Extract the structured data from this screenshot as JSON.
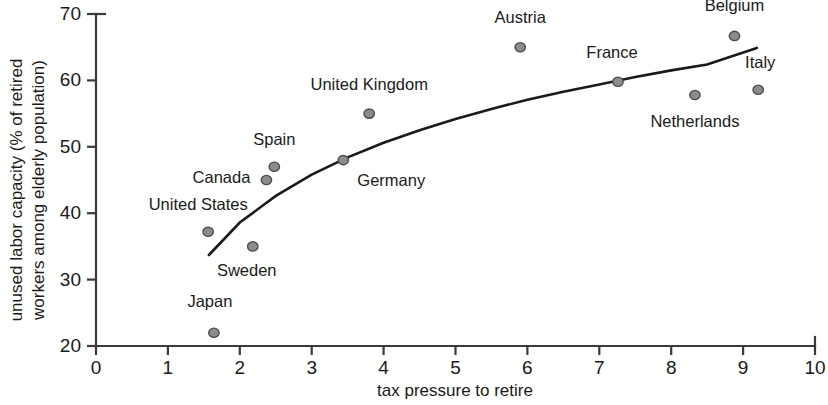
{
  "chart_data": {
    "type": "scatter",
    "title": "",
    "xlabel": "tax pressure to retire",
    "ylabel": "unused labor capacity (% of retired workers among elderly population)",
    "ylabel_line1": "unused labor capacity (% of retired",
    "ylabel_line2": "workers among elderly population)",
    "xlim": [
      0,
      10
    ],
    "ylim": [
      20,
      70
    ],
    "xticks": [
      "0",
      "1",
      "2",
      "3",
      "4",
      "5",
      "6",
      "7",
      "8",
      "9",
      "10"
    ],
    "xtick_values": [
      0,
      1,
      2,
      3,
      4,
      5,
      6,
      7,
      8,
      9,
      10
    ],
    "yticks": [
      "20",
      "30",
      "40",
      "50",
      "60",
      "70"
    ],
    "ytick_values": [
      20,
      30,
      40,
      50,
      60,
      70
    ],
    "grid": false,
    "legend": "none",
    "marker_color": "#8c8c8c",
    "marker_edge_color": "#4d4d4d",
    "curve_color": "#1a1a1a",
    "points": [
      {
        "label": "Japan",
        "x": 1.64,
        "y": 22.0,
        "label_dx": -4,
        "label_dy": -26,
        "anchor": "middle"
      },
      {
        "label": "United States",
        "x": 1.56,
        "y": 37.2,
        "label_dx": -10,
        "label_dy": -22,
        "anchor": "middle"
      },
      {
        "label": "Sweden",
        "x": 2.18,
        "y": 35.0,
        "label_dx": -6,
        "label_dy": 30,
        "anchor": "middle"
      },
      {
        "label": "Canada",
        "x": 2.37,
        "y": 45.0,
        "label_dx": -16,
        "label_dy": 3,
        "anchor": "end"
      },
      {
        "label": "Spain",
        "x": 2.48,
        "y": 47.0,
        "label_dx": 0,
        "label_dy": -22,
        "anchor": "middle"
      },
      {
        "label": "Germany",
        "x": 3.44,
        "y": 48.0,
        "label_dx": 14,
        "label_dy": 26,
        "anchor": "start"
      },
      {
        "label": "United Kingdom",
        "x": 3.8,
        "y": 55.0,
        "label_dx": 0,
        "label_dy": -24,
        "anchor": "middle"
      },
      {
        "label": "Austria",
        "x": 5.9,
        "y": 65.0,
        "label_dx": 0,
        "label_dy": -24,
        "anchor": "middle"
      },
      {
        "label": "France",
        "x": 7.26,
        "y": 59.8,
        "label_dx": -6,
        "label_dy": -24,
        "anchor": "middle"
      },
      {
        "label": "Netherlands",
        "x": 8.33,
        "y": 57.8,
        "label_dx": 0,
        "label_dy": 32,
        "anchor": "middle"
      },
      {
        "label": "Belgium",
        "x": 8.88,
        "y": 66.7,
        "label_dx": 0,
        "label_dy": -25,
        "anchor": "middle"
      },
      {
        "label": "Italy",
        "x": 9.21,
        "y": 58.6,
        "label_dx": 2,
        "label_dy": -22,
        "anchor": "middle"
      }
    ],
    "trend_curve": {
      "description": "fitted logarithmic trend line",
      "x_start": 1.57,
      "x_end": 9.19,
      "points": [
        {
          "x": 1.57,
          "y": 33.7
        },
        {
          "x": 2.0,
          "y": 38.6
        },
        {
          "x": 2.5,
          "y": 42.6
        },
        {
          "x": 3.0,
          "y": 45.8
        },
        {
          "x": 3.5,
          "y": 48.4
        },
        {
          "x": 4.0,
          "y": 50.6
        },
        {
          "x": 4.5,
          "y": 52.5
        },
        {
          "x": 5.0,
          "y": 54.2
        },
        {
          "x": 5.5,
          "y": 55.7
        },
        {
          "x": 6.0,
          "y": 57.1
        },
        {
          "x": 6.5,
          "y": 58.3
        },
        {
          "x": 7.0,
          "y": 59.4
        },
        {
          "x": 7.5,
          "y": 60.5
        },
        {
          "x": 8.0,
          "y": 61.5
        },
        {
          "x": 8.5,
          "y": 62.4
        },
        {
          "x": 9.19,
          "y": 64.9
        }
      ]
    }
  }
}
